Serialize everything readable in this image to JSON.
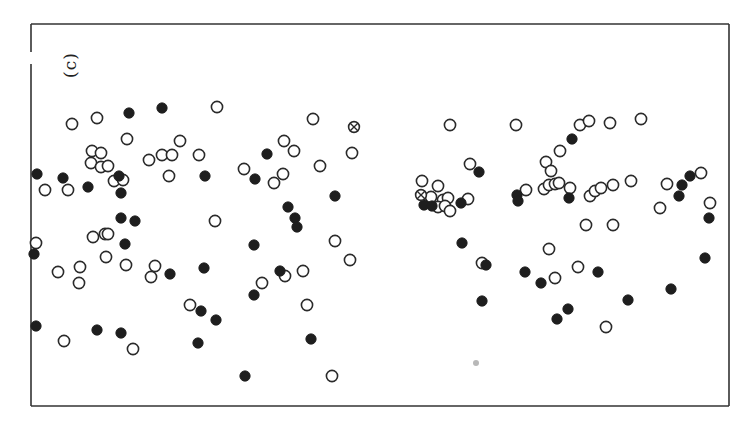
{
  "chart_data": {
    "type": "scatter",
    "title": "",
    "panel_label": "(c)",
    "xlabel": "",
    "ylabel": "",
    "grid": false,
    "legend": null,
    "axes_ticks": "none",
    "frame": {
      "left": 31,
      "top": 24,
      "right": 729,
      "bottom": 406
    },
    "coordinate_note": "points given in image pixel coordinates (x right, y down) inside the frame",
    "colors": {
      "frame": "#333333",
      "marker_edge": "#2a2a2a",
      "filled_marker": "#1e1e1e",
      "faint_marker": "#b8b8b8"
    },
    "series": [
      {
        "name": "open",
        "marker": "open-circle",
        "points": [
          [
            72,
            124
          ],
          [
            97,
            118
          ],
          [
            217,
            107
          ],
          [
            127,
            139
          ],
          [
            92,
            151
          ],
          [
            101,
            153
          ],
          [
            91,
            163
          ],
          [
            101,
            167
          ],
          [
            108,
            166
          ],
          [
            45,
            190
          ],
          [
            68,
            190
          ],
          [
            114,
            181
          ],
          [
            123,
            180
          ],
          [
            149,
            160
          ],
          [
            162,
            155
          ],
          [
            172,
            155
          ],
          [
            180,
            141
          ],
          [
            199,
            155
          ],
          [
            169,
            176
          ],
          [
            215,
            221
          ],
          [
            93,
            237
          ],
          [
            105,
            234
          ],
          [
            108,
            234
          ],
          [
            36,
            243
          ],
          [
            106,
            257
          ],
          [
            126,
            265
          ],
          [
            58,
            272
          ],
          [
            80,
            267
          ],
          [
            79,
            283
          ],
          [
            155,
            266
          ],
          [
            151,
            277
          ],
          [
            64,
            341
          ],
          [
            133,
            349
          ],
          [
            190,
            305
          ],
          [
            313,
            119
          ],
          [
            284,
            141
          ],
          [
            294,
            151
          ],
          [
            352,
            153
          ],
          [
            320,
            166
          ],
          [
            244,
            169
          ],
          [
            283,
            174
          ],
          [
            274,
            183
          ],
          [
            335,
            241
          ],
          [
            350,
            260
          ],
          [
            285,
            276
          ],
          [
            303,
            271
          ],
          [
            262,
            283
          ],
          [
            307,
            305
          ],
          [
            332,
            376
          ],
          [
            450,
            125
          ],
          [
            516,
            125
          ],
          [
            470,
            164
          ],
          [
            422,
            181
          ],
          [
            438,
            186
          ],
          [
            431,
            197
          ],
          [
            443,
            200
          ],
          [
            448,
            198
          ],
          [
            438,
            207
          ],
          [
            445,
            206
          ],
          [
            450,
            211
          ],
          [
            468,
            199
          ],
          [
            580,
            125
          ],
          [
            589,
            121
          ],
          [
            610,
            123
          ],
          [
            641,
            119
          ],
          [
            560,
            151
          ],
          [
            546,
            162
          ],
          [
            551,
            171
          ],
          [
            544,
            189
          ],
          [
            549,
            185
          ],
          [
            555,
            184
          ],
          [
            559,
            183
          ],
          [
            570,
            188
          ],
          [
            526,
            190
          ],
          [
            590,
            196
          ],
          [
            595,
            191
          ],
          [
            601,
            188
          ],
          [
            613,
            185
          ],
          [
            631,
            181
          ],
          [
            667,
            184
          ],
          [
            701,
            173
          ],
          [
            660,
            208
          ],
          [
            710,
            203
          ],
          [
            586,
            225
          ],
          [
            613,
            225
          ],
          [
            549,
            249
          ],
          [
            482,
            263
          ],
          [
            555,
            278
          ],
          [
            578,
            267
          ],
          [
            606,
            327
          ]
        ]
      },
      {
        "name": "filled",
        "marker": "filled-circle",
        "points": [
          [
            129,
            113
          ],
          [
            162,
            108
          ],
          [
            37,
            174
          ],
          [
            63,
            178
          ],
          [
            88,
            187
          ],
          [
            119,
            176
          ],
          [
            121,
            193
          ],
          [
            205,
            176
          ],
          [
            121,
            218
          ],
          [
            135,
            221
          ],
          [
            125,
            244
          ],
          [
            34,
            254
          ],
          [
            170,
            274
          ],
          [
            204,
            268
          ],
          [
            201,
            311
          ],
          [
            216,
            320
          ],
          [
            36,
            326
          ],
          [
            97,
            330
          ],
          [
            121,
            333
          ],
          [
            198,
            343
          ],
          [
            245,
            376
          ],
          [
            267,
            154
          ],
          [
            255,
            179
          ],
          [
            335,
            196
          ],
          [
            288,
            207
          ],
          [
            295,
            218
          ],
          [
            297,
            227
          ],
          [
            254,
            245
          ],
          [
            280,
            271
          ],
          [
            254,
            295
          ],
          [
            311,
            339
          ],
          [
            479,
            172
          ],
          [
            424,
            205
          ],
          [
            432,
            206
          ],
          [
            461,
            203
          ],
          [
            517,
            195
          ],
          [
            518,
            201
          ],
          [
            572,
            139
          ],
          [
            569,
            198
          ],
          [
            690,
            176
          ],
          [
            682,
            185
          ],
          [
            679,
            196
          ],
          [
            709,
            218
          ],
          [
            462,
            243
          ],
          [
            486,
            265
          ],
          [
            525,
            272
          ],
          [
            541,
            283
          ],
          [
            598,
            272
          ],
          [
            482,
            301
          ],
          [
            568,
            309
          ],
          [
            557,
            319
          ],
          [
            705,
            258
          ],
          [
            671,
            289
          ],
          [
            628,
            300
          ]
        ]
      },
      {
        "name": "crossed",
        "marker": "crossed-circle",
        "points": [
          [
            354,
            127
          ],
          [
            421,
            195
          ]
        ]
      },
      {
        "name": "faint",
        "marker": "faint-dot",
        "points": [
          [
            476,
            363
          ]
        ]
      }
    ]
  }
}
